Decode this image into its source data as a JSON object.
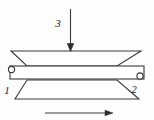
{
  "figure": {
    "kind": "mechanism-schematic",
    "background_color": "#fdfdfd",
    "line_color": "#3a3a3a",
    "fill_color": "#ffffff",
    "labels": {
      "left_support": "1",
      "right_support": "2",
      "applied_force": "3"
    },
    "parts": {
      "upper_plate_name": "upper-trapezoid-plate",
      "lower_plate_name": "lower-trapezoid-plate",
      "beam_name": "horizontal-beam",
      "force_arrow_name": "downward-force-arrow",
      "motion_arrow_name": "rightward-motion-arrow"
    },
    "geometry": {
      "upper_top_edge": {
        "x1": 11,
        "x2": 141,
        "y": 51
      },
      "upper_bottom_edge": {
        "x1": 27,
        "x2": 117,
        "y": 66
      },
      "lower_top_edge": {
        "x1": 27,
        "x2": 117,
        "y": 80
      },
      "lower_bottom_edge": {
        "x1": 15,
        "x2": 139,
        "y": 99
      },
      "beam": {
        "x": 10,
        "y": 66,
        "w": 134,
        "h": 13
      },
      "left_pin": {
        "cx": 11,
        "cy": 69,
        "r": 3
      },
      "right_pin": {
        "cx": 140,
        "cy": 76,
        "r": 3
      },
      "force_arrow": {
        "x": 70,
        "y1": 9,
        "y2": 50
      },
      "motion_arrow": {
        "y": 113,
        "x1": 45,
        "x2": 113
      }
    }
  }
}
